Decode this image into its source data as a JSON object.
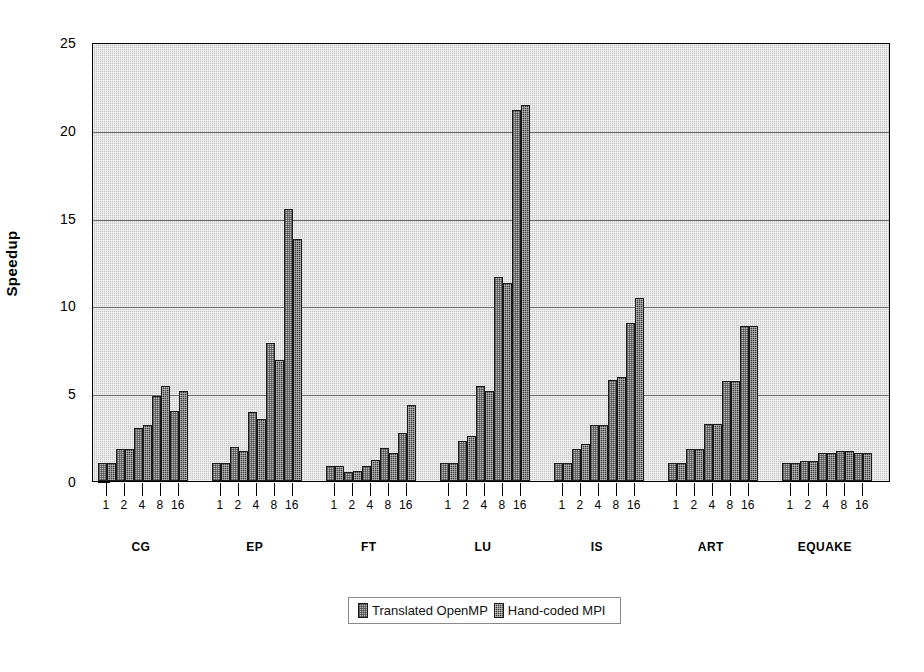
{
  "chart_data": {
    "type": "bar",
    "title": "",
    "xlabel": "",
    "ylabel": "Speedup",
    "ylim": [
      0,
      25
    ],
    "yticks": [
      0,
      5,
      10,
      15,
      20,
      25
    ],
    "grid": true,
    "legend_position": "bottom-center",
    "groups": [
      "CG",
      "EP",
      "FT",
      "LU",
      "IS",
      "ART",
      "EQUAKE"
    ],
    "categories": [
      "1",
      "2",
      "4",
      "8",
      "16"
    ],
    "series": [
      {
        "name": "Translated OpenMP",
        "color": "#b6b6b6",
        "values_by_group": {
          "CG": [
            1.0,
            1.8,
            3.0,
            4.85,
            4.0
          ],
          "EP": [
            1.0,
            1.95,
            3.95,
            7.85,
            15.5
          ],
          "FT": [
            0.85,
            0.5,
            0.85,
            1.9,
            2.75
          ],
          "LU": [
            1.0,
            2.3,
            5.4,
            11.6,
            21.1
          ],
          "IS": [
            1.0,
            1.85,
            3.2,
            5.75,
            9.0
          ],
          "ART": [
            1.0,
            1.8,
            3.25,
            5.7,
            8.8
          ],
          "EQUAKE": [
            1.0,
            1.15,
            1.6,
            1.7,
            1.6
          ]
        }
      },
      {
        "name": "Hand-coded MPI",
        "color": "#3c3c3c",
        "values_by_group": {
          "CG": [
            1.0,
            1.8,
            3.2,
            5.4,
            5.15
          ],
          "EP": [
            1.0,
            1.7,
            3.55,
            6.9,
            13.8
          ],
          "FT": [
            0.85,
            0.55,
            1.2,
            1.6,
            4.35
          ],
          "LU": [
            1.0,
            2.55,
            5.15,
            11.3,
            21.4
          ],
          "IS": [
            1.0,
            2.1,
            3.2,
            5.9,
            10.4
          ],
          "ART": [
            1.0,
            1.8,
            3.25,
            5.7,
            8.8
          ],
          "EQUAKE": [
            1.0,
            1.15,
            1.6,
            1.7,
            1.6
          ]
        }
      }
    ]
  },
  "axis": {
    "y_title": "Speedup",
    "y_tick_labels": [
      "0",
      "5",
      "10",
      "15",
      "20",
      "25"
    ]
  },
  "legend": {
    "entries": [
      {
        "label": "Translated OpenMP"
      },
      {
        "label": "Hand-coded MPI"
      }
    ]
  }
}
